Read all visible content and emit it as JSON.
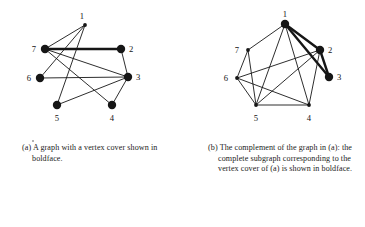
{
  "figure": {
    "panels": [
      {
        "id": "a",
        "caption": "(a) A graph with a vertex cover shown in boldface.",
        "graph": {
          "layout": "free",
          "vertices": [
            {
              "id": "1",
              "label": "1",
              "x": 85,
              "y": 25,
              "bold": false,
              "label_dx": -1,
              "label_dy": -6
            },
            {
              "id": "2",
              "label": "2",
              "x": 121,
              "y": 49,
              "bold": true,
              "label_dx": 8,
              "label_dy": 3
            },
            {
              "id": "3",
              "label": "3",
              "x": 128,
              "y": 77,
              "bold": true,
              "label_dx": 8,
              "label_dy": 3
            },
            {
              "id": "4",
              "label": "4",
              "x": 112,
              "y": 105,
              "bold": true,
              "label_dx": 0,
              "label_dy": 16
            },
            {
              "id": "5",
              "label": "5",
              "x": 57,
              "y": 105,
              "bold": true,
              "label_dx": 0,
              "label_dy": 16
            },
            {
              "id": "6",
              "label": "6",
              "x": 40,
              "y": 78,
              "bold": true,
              "label_dx": -9,
              "label_dy": 3
            },
            {
              "id": "7",
              "label": "7",
              "x": 45,
              "y": 49,
              "bold": true,
              "label_dx": -9,
              "label_dy": 3
            }
          ],
          "edges": [
            {
              "from": "1",
              "to": "5",
              "bold": false
            },
            {
              "from": "1",
              "to": "6",
              "bold": false
            },
            {
              "from": "1",
              "to": "7",
              "bold": false
            },
            {
              "from": "7",
              "to": "2",
              "bold": true
            },
            {
              "from": "7",
              "to": "3",
              "bold": false
            },
            {
              "from": "7",
              "to": "4",
              "bold": false
            },
            {
              "from": "2",
              "to": "3",
              "bold": false
            },
            {
              "from": "3",
              "to": "6",
              "bold": false
            },
            {
              "from": "3",
              "to": "5",
              "bold": false
            },
            {
              "from": "3",
              "to": "4",
              "bold": false
            }
          ]
        }
      },
      {
        "id": "b",
        "caption": "(b) The complement of the graph in (a): the complete subgraph corresponding to the vertex cover of (a) is shown in boldface.",
        "graph": {
          "layout": "pentagon",
          "vertices": [
            {
              "id": "1",
              "label": "1",
              "x": 102,
              "y": 24,
              "bold": true,
              "label_dx": 0,
              "label_dy": -7
            },
            {
              "id": "2",
              "label": "2",
              "x": 137,
              "y": 50,
              "bold": true,
              "label_dx": 8,
              "label_dy": 3
            },
            {
              "id": "3",
              "label": "3",
              "x": 146,
              "y": 77,
              "bold": true,
              "label_dx": 8,
              "label_dy": 3
            },
            {
              "id": "4",
              "label": "4",
              "x": 126,
              "y": 105,
              "bold": false,
              "label_dx": 0,
              "label_dy": 16
            },
            {
              "id": "5",
              "label": "5",
              "x": 73,
              "y": 105,
              "bold": false,
              "label_dx": 0,
              "label_dy": 16
            },
            {
              "id": "6",
              "label": "6",
              "x": 54,
              "y": 78,
              "bold": false,
              "label_dx": -9,
              "label_dy": 3
            },
            {
              "id": "7",
              "label": "7",
              "x": 65,
              "y": 50,
              "bold": false,
              "label_dx": -9,
              "label_dy": 3
            }
          ],
          "edges": [
            {
              "from": "1",
              "to": "2",
              "bold": true
            },
            {
              "from": "1",
              "to": "3",
              "bold": true
            },
            {
              "from": "2",
              "to": "3",
              "bold": true
            },
            {
              "from": "1",
              "to": "7",
              "bold": false
            },
            {
              "from": "1",
              "to": "4",
              "bold": false
            },
            {
              "from": "1",
              "to": "5",
              "bold": false
            },
            {
              "from": "2",
              "to": "6",
              "bold": false
            },
            {
              "from": "2",
              "to": "5",
              "bold": false
            },
            {
              "from": "2",
              "to": "4",
              "bold": false
            },
            {
              "from": "7",
              "to": "6",
              "bold": false
            },
            {
              "from": "7",
              "to": "5",
              "bold": false
            },
            {
              "from": "6",
              "to": "5",
              "bold": false
            },
            {
              "from": "6",
              "to": "4",
              "bold": false
            },
            {
              "from": "5",
              "to": "4",
              "bold": false
            }
          ]
        }
      }
    ],
    "style": {
      "ink": "#161616",
      "background": "#ffffff",
      "bold_vertex_radius": 4.2,
      "plain_vertex_radius": 1.9,
      "bold_edge_width": 2.4,
      "plain_edge_width": 0.9
    }
  }
}
